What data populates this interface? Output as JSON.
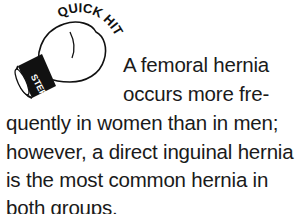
{
  "badge": {
    "top_text": "QUICK HIT",
    "band_text": "STEP-UP"
  },
  "body": {
    "lines": [
      "A femoral hernia",
      "occurs more fre-",
      "quently in women than in men;",
      "however, a direct inguinal hernia",
      "is the most common hernia in",
      "both groups."
    ]
  }
}
